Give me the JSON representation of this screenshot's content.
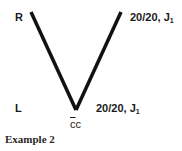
{
  "diagram": {
    "eye_labels": {
      "right": "R",
      "left": "L"
    },
    "right_eye_acuity": {
      "value": "20/20, J",
      "subscript": "1"
    },
    "left_eye_acuity": {
      "value": "20/20, J",
      "subscript": "1"
    },
    "correction": {
      "overlined": "c",
      "rest": "c"
    },
    "caption": "Example 2",
    "line_color": "#111111"
  }
}
